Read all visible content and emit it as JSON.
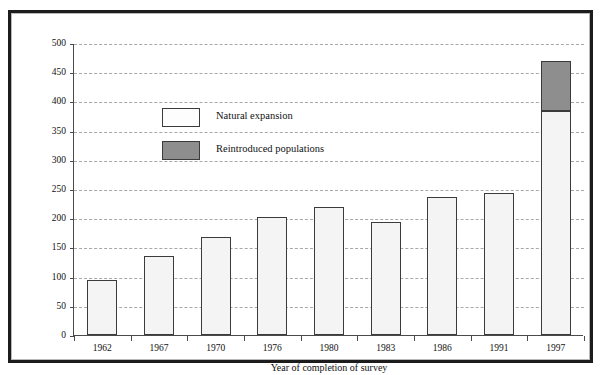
{
  "chart_data": {
    "type": "bar",
    "title": "",
    "subtitle": "",
    "xlabel": "Year of completion of survey",
    "ylabel": "Number of 10km squares recorded as occupied",
    "categories": [
      "1962",
      "1967",
      "1970",
      "1976",
      "1980",
      "1983",
      "1986",
      "1991",
      "1997"
    ],
    "series": [
      {
        "name": "Natural expansion",
        "color": "#f4f4f4",
        "values": [
          95,
          135,
          168,
          202,
          220,
          193,
          237,
          243,
          383
        ]
      },
      {
        "name": "Reintroduced populations",
        "color": "#8e8e8e",
        "values": [
          0,
          0,
          0,
          0,
          0,
          0,
          0,
          0,
          87
        ]
      }
    ],
    "totals": [
      95,
      135,
      168,
      202,
      220,
      193,
      237,
      243,
      470
    ],
    "stacked": true,
    "ylim": [
      0,
      500
    ],
    "ytick_step": 50,
    "yticks": [
      0,
      50,
      100,
      150,
      200,
      250,
      300,
      350,
      400,
      450,
      500
    ],
    "ytick_labels": [
      "0",
      "50",
      "100",
      "150",
      "200",
      "250",
      "300",
      "350",
      "400",
      "450",
      "500"
    ],
    "grid": "horizontal-dashed",
    "legend_position": "inside-upper-left",
    "legend": [
      {
        "label": "Natural expansion",
        "swatch": "white"
      },
      {
        "label": "Reintroduced populations",
        "swatch": "gray"
      }
    ],
    "colors": {
      "bar_natural": "#f4f4f4",
      "bar_reintroduced": "#8e8e8e",
      "bar_outline": "#3b3b3b",
      "axis": "#4a4a4a",
      "grid": "#a8a8a8",
      "frame": "#1c1c1c",
      "background": "#ffffff"
    }
  }
}
